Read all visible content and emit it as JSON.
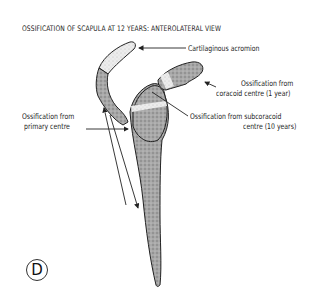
{
  "figure": {
    "title": "OSSIFICATION OF SCAPULA AT 12 YEARS: ANTEROLATERAL VIEW",
    "panel_letter": "D"
  },
  "labels": {
    "acromion": "Cartilaginous acromion",
    "coracoid_line1": "Ossification from",
    "coracoid_line2": "coracoid centre (1 year)",
    "subcoracoid_line1": "Ossification from subcoracoid",
    "subcoracoid_line2": "centre (10 years)",
    "primary_line1": "Ossification from",
    "primary_line2": "primary centre"
  },
  "colors": {
    "bone_fill": "#9a9a9a",
    "cartilage_fill": "#e4e4e4",
    "outline": "#222222"
  }
}
